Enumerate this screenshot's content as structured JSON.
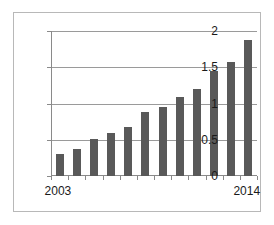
{
  "chart_data": {
    "type": "bar",
    "title": "",
    "xlabel": "",
    "ylabel": "",
    "categories": [
      "2003",
      "2004",
      "2005",
      "2006",
      "2007",
      "2008",
      "2009",
      "2010",
      "2011",
      "2012",
      "2013",
      "2014"
    ],
    "values": [
      0.3,
      0.37,
      0.51,
      0.59,
      0.67,
      0.88,
      0.95,
      1.09,
      1.2,
      1.45,
      1.57,
      1.87
    ],
    "ylim": [
      0,
      2
    ],
    "ytick_labels": [
      "0",
      "0.5",
      "1",
      "1.5",
      "2"
    ],
    "ytick_values": [
      0,
      0.5,
      1,
      1.5,
      2
    ],
    "xtick_labels_shown": [
      "2003",
      "2014"
    ],
    "grid": true,
    "legend": "none",
    "series": [
      {
        "name": "series-1",
        "values": [
          0.3,
          0.37,
          0.51,
          0.59,
          0.67,
          0.88,
          0.95,
          1.09,
          1.2,
          1.45,
          1.57,
          1.87
        ]
      }
    ],
    "colors": {
      "bar": "#595959",
      "gridline": "#9a9a9a",
      "axis": "#8a8a8a",
      "frame": "#b8b8b8",
      "background": "#ffffff",
      "text": "#1a1a1a"
    }
  }
}
